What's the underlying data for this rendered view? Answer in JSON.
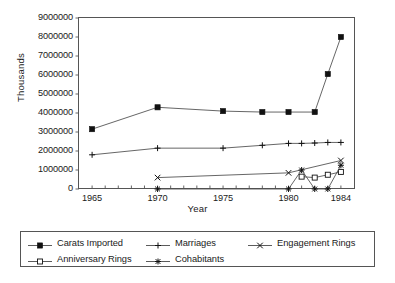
{
  "chart_data": {
    "type": "line",
    "title": "",
    "xlabel": "Year",
    "ylabel": "Thousands",
    "x": [
      1965,
      1970,
      1975,
      1978,
      1979,
      1980,
      1981,
      1982,
      1983,
      1984
    ],
    "xtick_labels": [
      "1965",
      "1970",
      "1975",
      "1980",
      "1984"
    ],
    "ytick_labels": [
      "0",
      "1000000",
      "2000000",
      "3000000",
      "4000000",
      "5000000",
      "6000000",
      "7000000",
      "8000000",
      "9000000"
    ],
    "xlim": [
      1964,
      1985
    ],
    "ylim": [
      0,
      9000000
    ],
    "grid": false,
    "legend_position": "bottom",
    "series": [
      {
        "name": "Carats Imported",
        "marker": "filled-square",
        "x": [
          1965,
          1970,
          1975,
          1978,
          1980,
          1982,
          1983,
          1984
        ],
        "values": [
          3150000,
          4300000,
          4100000,
          4050000,
          4050000,
          4050000,
          6050000,
          8000000
        ]
      },
      {
        "name": "Marriages",
        "marker": "plus",
        "x": [
          1965,
          1970,
          1975,
          1978,
          1980,
          1981,
          1982,
          1983,
          1984
        ],
        "values": [
          1800000,
          2150000,
          2150000,
          2300000,
          2400000,
          2400000,
          2420000,
          2450000,
          2450000
        ]
      },
      {
        "name": "Engagement Rings",
        "marker": "cross",
        "x": [
          1970,
          1980,
          1984
        ],
        "values": [
          600000,
          850000,
          1500000
        ]
      },
      {
        "name": "Anniversary Rings",
        "marker": "open-square",
        "x": [
          1981,
          1982,
          1983,
          1984
        ],
        "values": [
          650000,
          600000,
          750000,
          900000
        ]
      },
      {
        "name": "Cohabitants",
        "marker": "bowtie",
        "x": [
          1970,
          1980,
          1981,
          1982,
          1983,
          1984
        ],
        "values": [
          0,
          0,
          1000000,
          0,
          0,
          1250000
        ]
      }
    ]
  },
  "legend": {
    "items": [
      {
        "label": "Carats Imported",
        "marker": "filled-square"
      },
      {
        "label": "Marriages",
        "marker": "plus"
      },
      {
        "label": "Engagement Rings",
        "marker": "cross"
      },
      {
        "label": "Anniversary Rings",
        "marker": "open-square"
      },
      {
        "label": "Cohabitants",
        "marker": "bowtie"
      }
    ]
  },
  "colors": {
    "line": "#4a4a4a",
    "marker": "#111111",
    "frame": "#555555",
    "text": "#1a1a1a",
    "background": "#ffffff"
  }
}
